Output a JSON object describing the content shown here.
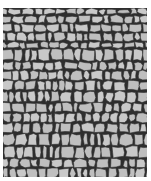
{
  "image": {
    "subject": "cobblestone texture",
    "description": "Irregular gray stones separated by dark mortar lines on white background",
    "colors": {
      "background": "#ffffff",
      "stone": "#bfbfbf",
      "stone_highlight": "#c9c9c9",
      "mortar": "#2e2e2e"
    },
    "texture_bounds": {
      "x": 3,
      "y": 8,
      "width": 144,
      "height": 169
    },
    "approx_stone_count": 300
  }
}
